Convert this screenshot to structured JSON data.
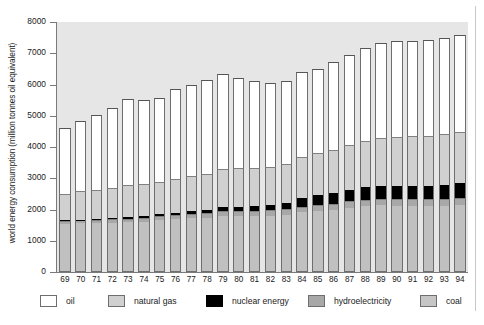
{
  "chart_data": {
    "type": "bar",
    "subtype": "stacked-vertical",
    "title": "",
    "xlabel": "",
    "ylabel": "world energy consumption (million tonnes oil equivalent)",
    "ylim": [
      0,
      8000
    ],
    "yticks": [
      0,
      1000,
      2000,
      3000,
      4000,
      5000,
      6000,
      7000,
      8000
    ],
    "ytick_labels": [
      "0",
      "1000",
      "2000",
      "3000",
      "4000",
      "5000",
      "6000",
      "7000",
      "8000"
    ],
    "grid": false,
    "legend_position": "bottom",
    "categories": [
      "69",
      "70",
      "71",
      "72",
      "73",
      "74",
      "75",
      "76",
      "77",
      "78",
      "79",
      "80",
      "81",
      "82",
      "83",
      "84",
      "85",
      "86",
      "87",
      "88",
      "89",
      "90",
      "91",
      "92",
      "93",
      "94"
    ],
    "stack_order_bottom_to_top": [
      "coal",
      "hydroelectricity",
      "nuclear energy",
      "natural gas",
      "oil"
    ],
    "series": [
      {
        "name": "coal",
        "color": "#c0c0c0",
        "values": [
          1540,
          1560,
          1560,
          1580,
          1595,
          1605,
          1650,
          1690,
          1720,
          1730,
          1790,
          1800,
          1790,
          1800,
          1840,
          1910,
          1960,
          1990,
          2060,
          2110,
          2130,
          2120,
          2110,
          2100,
          2110,
          2130
        ]
      },
      {
        "name": "hydroelectricity",
        "color": "#a8a8a8",
        "values": [
          90,
          95,
          100,
          105,
          115,
          125,
          130,
          130,
          140,
          145,
          155,
          160,
          165,
          170,
          175,
          185,
          190,
          195,
          200,
          205,
          210,
          215,
          220,
          225,
          235,
          240
        ]
      },
      {
        "name": "nuclear energy",
        "color": "#000000",
        "values": [
          20,
          25,
          30,
          35,
          45,
          55,
          70,
          80,
          95,
          110,
          120,
          135,
          160,
          175,
          205,
          260,
          330,
          350,
          375,
          400,
          420,
          430,
          435,
          440,
          455,
          465
        ]
      },
      {
        "name": "natural gas",
        "color": "#d0d0d0",
        "values": [
          860,
          900,
          950,
          980,
          1020,
          1020,
          1040,
          1090,
          1110,
          1160,
          1220,
          1220,
          1225,
          1210,
          1230,
          1310,
          1320,
          1360,
          1430,
          1480,
          1540,
          1570,
          1590,
          1600,
          1620,
          1640
        ]
      },
      {
        "name": "oil",
        "color": "#ffffff",
        "values": [
          2100,
          2250,
          2400,
          2560,
          2750,
          2700,
          2680,
          2880,
          2925,
          3010,
          3050,
          2890,
          2760,
          2685,
          2670,
          2735,
          2700,
          2810,
          2865,
          2960,
          3020,
          3055,
          3045,
          3075,
          3080,
          3125
        ]
      }
    ],
    "totals": [
      4610,
      4830,
      5040,
      5260,
      5525,
      5505,
      5570,
      5870,
      5990,
      6155,
      6335,
      6205,
      6100,
      6040,
      6120,
      6400,
      6500,
      6705,
      6930,
      7155,
      7320,
      7390,
      7400,
      7440,
      7500,
      7600
    ]
  },
  "legend": {
    "items": [
      {
        "label": "oil",
        "swatch": "sw-oil"
      },
      {
        "label": "natural gas",
        "swatch": "sw-gas"
      },
      {
        "label": "nuclear energy",
        "swatch": "sw-nuc"
      },
      {
        "label": "hydroelectricity",
        "swatch": "sw-hyd"
      },
      {
        "label": "coal",
        "swatch": "sw-coal"
      }
    ]
  }
}
